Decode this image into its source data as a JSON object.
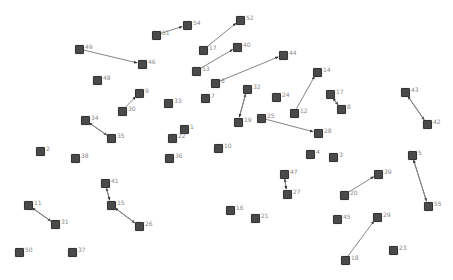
{
  "graph": {
    "background": "#ffffff",
    "node_color": "#4a4a4a",
    "edge_color": "#777777",
    "label_color": "#888888",
    "nodes": [
      {
        "id": "49",
        "x": 79,
        "y": 49
      },
      {
        "id": "46",
        "x": 142,
        "y": 64
      },
      {
        "id": "48",
        "x": 97,
        "y": 80
      },
      {
        "id": "51",
        "x": 156,
        "y": 35
      },
      {
        "id": "54",
        "x": 187,
        "y": 25
      },
      {
        "id": "52",
        "x": 240,
        "y": 20
      },
      {
        "id": "17a",
        "label": "17",
        "x": 203,
        "y": 50
      },
      {
        "id": "40",
        "x": 237,
        "y": 47
      },
      {
        "id": "53",
        "x": 196,
        "y": 71
      },
      {
        "id": "44",
        "x": 283,
        "y": 55
      },
      {
        "id": "6",
        "x": 215,
        "y": 83
      },
      {
        "id": "9",
        "x": 139,
        "y": 93
      },
      {
        "id": "30",
        "x": 122,
        "y": 111
      },
      {
        "id": "33",
        "x": 168,
        "y": 103
      },
      {
        "id": "7",
        "x": 205,
        "y": 98
      },
      {
        "id": "32",
        "x": 247,
        "y": 89
      },
      {
        "id": "24",
        "x": 276,
        "y": 97
      },
      {
        "id": "14",
        "x": 317,
        "y": 72
      },
      {
        "id": "17b",
        "label": "17",
        "x": 330,
        "y": 94
      },
      {
        "id": "8",
        "x": 341,
        "y": 109
      },
      {
        "id": "12",
        "x": 294,
        "y": 113
      },
      {
        "id": "43",
        "x": 405,
        "y": 92
      },
      {
        "id": "42",
        "x": 427,
        "y": 124
      },
      {
        "id": "34",
        "x": 85,
        "y": 120
      },
      {
        "id": "35",
        "x": 111,
        "y": 138
      },
      {
        "id": "19",
        "x": 238,
        "y": 122
      },
      {
        "id": "25",
        "x": 261,
        "y": 118
      },
      {
        "id": "28",
        "x": 318,
        "y": 133
      },
      {
        "id": "1",
        "x": 184,
        "y": 129
      },
      {
        "id": "22",
        "x": 172,
        "y": 138
      },
      {
        "id": "10",
        "x": 218,
        "y": 148
      },
      {
        "id": "2",
        "x": 40,
        "y": 151
      },
      {
        "id": "38",
        "x": 75,
        "y": 158
      },
      {
        "id": "36",
        "x": 169,
        "y": 158
      },
      {
        "id": "4",
        "x": 310,
        "y": 154
      },
      {
        "id": "3",
        "x": 333,
        "y": 157
      },
      {
        "id": "5",
        "x": 412,
        "y": 155
      },
      {
        "id": "47",
        "x": 284,
        "y": 174
      },
      {
        "id": "27",
        "x": 287,
        "y": 194
      },
      {
        "id": "39",
        "x": 378,
        "y": 174
      },
      {
        "id": "20",
        "x": 344,
        "y": 195
      },
      {
        "id": "55",
        "x": 428,
        "y": 206
      },
      {
        "id": "41",
        "x": 105,
        "y": 183
      },
      {
        "id": "15",
        "x": 111,
        "y": 205
      },
      {
        "id": "26",
        "x": 139,
        "y": 226
      },
      {
        "id": "11",
        "x": 28,
        "y": 205
      },
      {
        "id": "31",
        "x": 55,
        "y": 224
      },
      {
        "id": "16",
        "x": 230,
        "y": 210
      },
      {
        "id": "21",
        "x": 255,
        "y": 218
      },
      {
        "id": "45",
        "x": 337,
        "y": 219
      },
      {
        "id": "29",
        "x": 377,
        "y": 217
      },
      {
        "id": "18",
        "x": 345,
        "y": 260
      },
      {
        "id": "23",
        "x": 393,
        "y": 250
      },
      {
        "id": "50",
        "x": 19,
        "y": 252
      },
      {
        "id": "37",
        "x": 72,
        "y": 252
      }
    ],
    "edges": [
      {
        "from": "49",
        "to": "46"
      },
      {
        "from": "51",
        "to": "54"
      },
      {
        "from": "17a",
        "to": "52"
      },
      {
        "from": "53",
        "to": "40"
      },
      {
        "from": "6",
        "to": "44"
      },
      {
        "from": "30",
        "to": "9"
      },
      {
        "from": "19",
        "to": "32"
      },
      {
        "from": "32",
        "to": "19"
      },
      {
        "from": "12",
        "to": "14"
      },
      {
        "from": "17b",
        "to": "8"
      },
      {
        "from": "8",
        "to": "17b"
      },
      {
        "from": "43",
        "to": "42"
      },
      {
        "from": "42",
        "to": "43"
      },
      {
        "from": "34",
        "to": "35"
      },
      {
        "from": "35",
        "to": "34"
      },
      {
        "from": "25",
        "to": "28"
      },
      {
        "from": "27",
        "to": "47"
      },
      {
        "from": "47",
        "to": "27"
      },
      {
        "from": "20",
        "to": "39"
      },
      {
        "from": "5",
        "to": "55"
      },
      {
        "from": "55",
        "to": "5"
      },
      {
        "from": "15",
        "to": "41"
      },
      {
        "from": "41",
        "to": "15"
      },
      {
        "from": "15",
        "to": "26"
      },
      {
        "from": "26",
        "to": "15"
      },
      {
        "from": "11",
        "to": "31"
      },
      {
        "from": "31",
        "to": "11"
      },
      {
        "from": "18",
        "to": "29"
      }
    ]
  }
}
